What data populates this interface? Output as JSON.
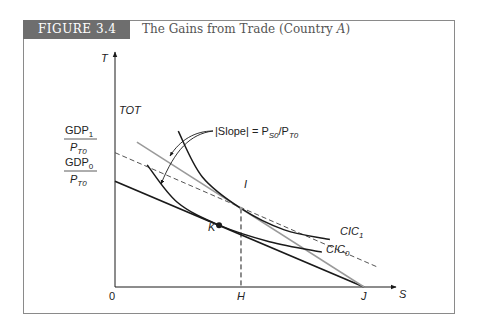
{
  "figure": {
    "tag": "FIGURE 3.4",
    "title_prefix": "The Gains from Trade (Country ",
    "title_italic": "A",
    "title_suffix": ")"
  },
  "colors": {
    "tag_bg": "#6e6e6e",
    "line_dark": "#1a1a1a",
    "line_gray": "#9a9a9a",
    "frame": "#8a8a8a"
  },
  "chart_data": {
    "type": "line",
    "title": "The Gains from Trade (Country A)",
    "xlabel": "S",
    "ylabel": "T",
    "origin_label": "0",
    "x_tick_labels": [
      "H",
      "J"
    ],
    "y_tick_labels": [
      {
        "num": "GDP",
        "num_sub": "1",
        "den": "P",
        "den_sub": "T0"
      },
      {
        "num": "GDP",
        "num_sub": "0",
        "den": "P",
        "den_sub": "T0"
      }
    ],
    "xlim": [
      0,
      10
    ],
    "ylim": [
      0,
      10
    ],
    "series": [
      {
        "name": "GDP0 budget line",
        "style": "solid-dark",
        "points": [
          [
            0,
            5.37
          ],
          [
            10,
            0
          ]
        ]
      },
      {
        "name": "GDP1 budget line",
        "style": "dashed",
        "points": [
          [
            0,
            6.82
          ],
          [
            10.6,
            0.98
          ]
        ]
      },
      {
        "name": "TOT",
        "style": "solid-gray",
        "points": [
          [
            0.88,
            7.35
          ],
          [
            10,
            0
          ]
        ]
      },
      {
        "name": "CIC1",
        "style": "curve-dark",
        "points": [
          [
            2.54,
            7.91
          ],
          [
            3.5,
            5.6
          ],
          [
            5.06,
            3.99
          ],
          [
            6.8,
            2.9
          ],
          [
            8.63,
            2.41
          ]
        ]
      },
      {
        "name": "CIC0",
        "style": "curve-dark",
        "points": [
          [
            1.29,
            6.2
          ],
          [
            2.5,
            4.3
          ],
          [
            4.18,
            3.14
          ],
          [
            6.2,
            2.3
          ],
          [
            8.31,
            1.77
          ]
        ]
      }
    ],
    "points": [
      {
        "label": "I",
        "x": 5.06,
        "y": 3.99
      },
      {
        "label": "K",
        "x": 4.18,
        "y": 3.14
      }
    ],
    "annotations": [
      {
        "text": "|Slope| = P",
        "sub1": "S0",
        "mid": "/P",
        "sub2": "T0"
      },
      {
        "text": "TOT"
      },
      {
        "text": "CIC",
        "sub": "1"
      },
      {
        "text": "CIC",
        "sub": "0"
      }
    ],
    "guides": [
      {
        "type": "vertical-dashed",
        "x": 5.06,
        "from_y": 0,
        "to_y": 3.99,
        "label": "H"
      }
    ],
    "grid": false
  }
}
